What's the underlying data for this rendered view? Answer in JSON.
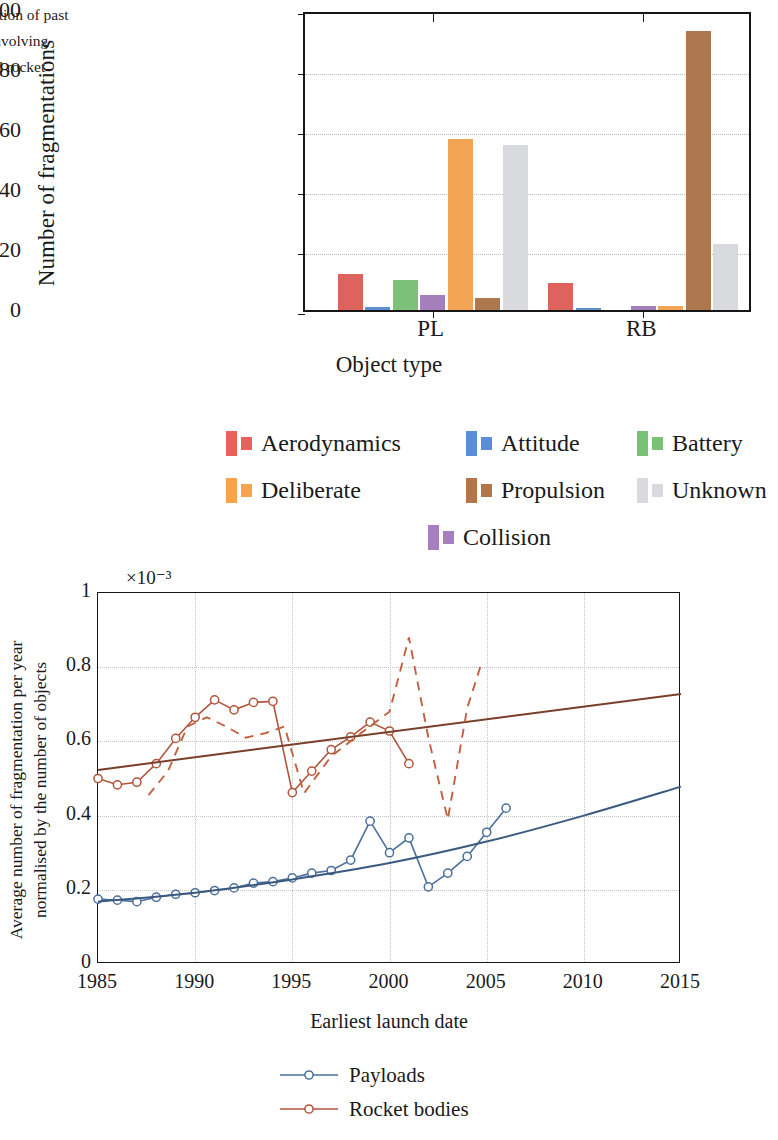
{
  "caption": {
    "text": "lassification of past\nations involving\n(PL) and rocket\nB)"
  },
  "figure1": {
    "ylabel": "Number of fragmentations",
    "xlabel": "Object type",
    "yticks": [
      "0",
      "20",
      "40",
      "60",
      "80",
      "100"
    ],
    "groups": [
      "PL",
      "RB"
    ]
  },
  "figure2": {
    "ylabel": "Average number of fragmentation per year\nnormalised by the number of objects",
    "xlabel": "Earliest launch date",
    "multiplier": "×10⁻³",
    "yticks": [
      "0",
      "0.2",
      "0.4",
      "0.6",
      "0.8",
      "1"
    ],
    "xticks": [
      "1985",
      "1990",
      "1995",
      "2000",
      "2005",
      "2010",
      "2015"
    ]
  },
  "legend1": [
    {
      "label": "Aerodynamics",
      "color": "#e8615a"
    },
    {
      "label": "Attitude",
      "color": "#5b8ed6"
    },
    {
      "label": "Battery",
      "color": "#78c276"
    },
    {
      "label": "Deliberate",
      "color": "#f8a44c"
    },
    {
      "label": "Propulsion",
      "color": "#b3764a"
    },
    {
      "label": "Unknown",
      "color": "#d9dade"
    },
    {
      "label": "Collision",
      "color": "#a77ec0"
    }
  ],
  "legend2": [
    {
      "label": "Payloads",
      "color": "#4a6f9c"
    },
    {
      "label": "Rocket bodies",
      "color": "#b0553c"
    }
  ],
  "chart_data": [
    {
      "type": "bar",
      "title": "",
      "xlabel": "Object type",
      "ylabel": "Number of fragmentations",
      "ylim": [
        0,
        100
      ],
      "grid": true,
      "legend_position": "below",
      "categories": [
        "PL",
        "RB"
      ],
      "series": [
        {
          "name": "Aerodynamics",
          "color": "#e8615a",
          "values": [
            12,
            9
          ]
        },
        {
          "name": "Attitude",
          "color": "#5b8ed6",
          "values": [
            1,
            0.4
          ]
        },
        {
          "name": "Battery",
          "color": "#78c276",
          "values": [
            10,
            0
          ]
        },
        {
          "name": "Collision",
          "color": "#a77ec0",
          "values": [
            5,
            1.5
          ]
        },
        {
          "name": "Deliberate",
          "color": "#f8a44c",
          "values": [
            57,
            1.5
          ]
        },
        {
          "name": "Propulsion",
          "color": "#b3764a",
          "values": [
            4,
            93
          ]
        },
        {
          "name": "Unknown",
          "color": "#d9dade",
          "values": [
            55,
            22
          ]
        }
      ]
    },
    {
      "type": "line",
      "title": "",
      "xlabel": "Earliest launch date",
      "ylabel": "Average number of fragmentation per year normalised by the number of objects",
      "multiplier": "×10⁻³",
      "xlim": [
        1985,
        2015
      ],
      "ylim": [
        0,
        1
      ],
      "grid": true,
      "legend_position": "below",
      "series": [
        {
          "name": "Payloads",
          "color": "#4a6f9c",
          "style": "solid-markers",
          "x": [
            1985,
            1986,
            1987,
            1988,
            1989,
            1990,
            1991,
            1992,
            1993,
            1994,
            1995,
            1996,
            1997,
            1998,
            1999,
            2000,
            2001,
            2002,
            2003,
            2004,
            2005,
            2006
          ],
          "y": [
            0.175,
            0.172,
            0.168,
            0.18,
            0.188,
            0.192,
            0.198,
            0.205,
            0.218,
            0.222,
            0.232,
            0.245,
            0.252,
            0.28,
            0.385,
            0.3,
            0.34,
            0.208,
            0.245,
            0.29,
            0.355,
            0.42
          ]
        },
        {
          "name": "Payloads trend",
          "color": "#3a5a80",
          "style": "solid-smooth",
          "x": [
            1985,
            1990,
            1995,
            2000,
            2005,
            2010,
            2015
          ],
          "y": [
            0.168,
            0.192,
            0.228,
            0.272,
            0.33,
            0.4,
            0.478
          ]
        },
        {
          "name": "Rocket bodies",
          "color": "#b0553c",
          "style": "solid-markers",
          "x": [
            1985,
            1986,
            1987,
            1988,
            1989,
            1990,
            1991,
            1992,
            1993,
            1994,
            1995,
            1996,
            1997,
            1998,
            1999,
            2000,
            2001
          ],
          "y": [
            0.5,
            0.483,
            0.49,
            0.54,
            0.608,
            0.665,
            0.712,
            0.685,
            0.705,
            0.708,
            0.462,
            0.52,
            0.578,
            0.612,
            0.652,
            0.628,
            0.54
          ]
        },
        {
          "name": "Rocket bodies trend",
          "color": "#7a3f2a",
          "style": "solid-straight",
          "x": [
            1985,
            2015
          ],
          "y": [
            0.523,
            0.728
          ]
        },
        {
          "name": "Rocket bodies dashed",
          "color": "#c4603f",
          "style": "dashed",
          "x": [
            1987.6,
            1988.6,
            1989.6,
            1990.6,
            1991.6,
            1992.6,
            1993.6,
            1994.6,
            1995.6,
            1997.0,
            1998.6,
            2000.0,
            2001.0,
            2002.0,
            2003.0,
            2004.0,
            2004.7
          ],
          "y": [
            0.455,
            0.52,
            0.64,
            0.665,
            0.64,
            0.61,
            0.622,
            0.64,
            0.46,
            0.56,
            0.625,
            0.68,
            0.88,
            0.61,
            0.39,
            0.69,
            0.805
          ]
        }
      ]
    }
  ]
}
